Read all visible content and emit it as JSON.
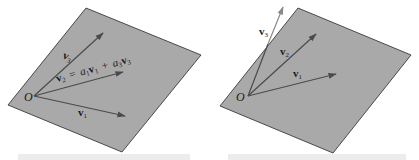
{
  "figure": {
    "colors": {
      "plane_fill": "#a9a9a9",
      "plane_edge": "#3a3a3a",
      "arrow": "#4a4a4a",
      "text": "#1a1a1a",
      "shadow_bar": "#ececec"
    },
    "panels": [
      {
        "id": "left",
        "description": "Linearly dependent: v2 lies in plane spanned by v1 and v3",
        "origin_label": "O",
        "vectors": [
          {
            "name": "v1",
            "base": "v",
            "sub": "1"
          },
          {
            "name": "v3",
            "base": "v",
            "sub": "3"
          }
        ],
        "equation": {
          "lhs_base": "v",
          "lhs_sub": "2",
          "eq": "=",
          "c1": "a",
          "c1_sub": "1",
          "v_a": "v",
          "v_a_sub": "1",
          "plus": "+",
          "c2": "a",
          "c2_sub": "3",
          "v_b": "v",
          "v_b_sub": "3"
        }
      },
      {
        "id": "right",
        "description": "Linearly independent: v3 leaves the plane of v1 and v2",
        "origin_label": "O",
        "vectors": [
          {
            "name": "v1",
            "base": "v",
            "sub": "1"
          },
          {
            "name": "v2",
            "base": "v",
            "sub": "2"
          },
          {
            "name": "v3",
            "base": "v",
            "sub": "3"
          }
        ]
      }
    ]
  }
}
